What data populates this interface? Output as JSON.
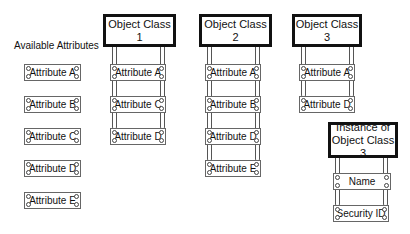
{
  "available": {
    "title": "Available Attributes",
    "items": [
      "Attribute A",
      "Attribute B",
      "Attribute C",
      "Attribute D",
      "Attribute E"
    ]
  },
  "classes": [
    {
      "title": "Object Class 1",
      "attributes": [
        "Attribute A",
        "Attribute C",
        "Attribute D"
      ]
    },
    {
      "title": "Object Class 2",
      "attributes": [
        "Attribute A",
        "Attribute B",
        "Attribute D",
        "Attribute E"
      ]
    },
    {
      "title": "Object Class 3",
      "attributes": [
        "Attribute A",
        "Attribute D"
      ]
    }
  ],
  "instance": {
    "title_line1": "Instance of",
    "title_line2": "Object Class 3",
    "attributes": [
      "Name",
      "Security ID"
    ]
  }
}
